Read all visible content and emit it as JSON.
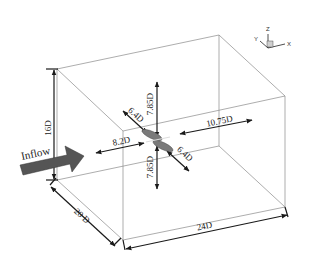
{
  "diagram": {
    "type": "computational-domain-schematic",
    "inflow_label": "Inflow",
    "colors": {
      "domain_edges": "#8a8a8a",
      "dimension_arrows": "#1a1a1a",
      "inflow_arrow": "#555555",
      "body": "#7a7a7a"
    },
    "dimensions": {
      "height": "16D",
      "width": "20 D",
      "length": "24D",
      "upstream": "8.2D",
      "downstream": "10.75D",
      "above": "7.85D",
      "below": "7.85D",
      "lateral_back": "6.4D",
      "lateral_front": "6.4D"
    },
    "axis_triad": {
      "x": "X",
      "y": "Y",
      "z": "Z"
    }
  }
}
